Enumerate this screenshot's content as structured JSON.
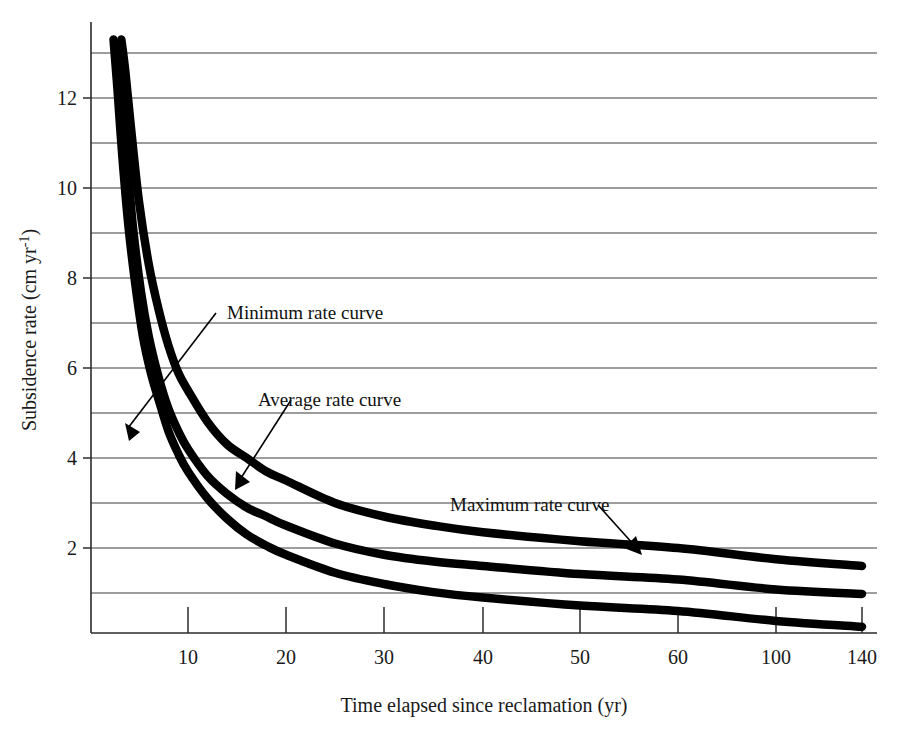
{
  "chart_data": {
    "type": "line",
    "title": "",
    "xlabel": "Time elapsed since reclamation (yr)",
    "ylabel": "Subsidence rate (cm yr-1)",
    "ylabel_parts": {
      "main": "Subsidence rate (cm yr",
      "superscript": "-1",
      "tail": ")"
    },
    "grid": true,
    "legend_position": "inline-annotations",
    "x_tick_labels": [
      "10",
      "20",
      "30",
      "40",
      "50",
      "60",
      "100",
      "140"
    ],
    "x_tick_values": [
      10,
      20,
      30,
      40,
      50,
      60,
      100,
      140
    ],
    "x_scale_note": "compressed / non-linear beyond 60",
    "y_tick_labels": [
      "2",
      "4",
      "6",
      "8",
      "10",
      "12"
    ],
    "y_tick_values": [
      2,
      4,
      6,
      8,
      10,
      12
    ],
    "y_gridline_values": [
      1,
      2,
      3,
      4,
      5,
      6,
      7,
      8,
      9,
      10,
      11,
      12,
      13
    ],
    "ylim": [
      0,
      13.4
    ],
    "annotations": [
      {
        "id": "minimum",
        "label": "Minimum rate curve"
      },
      {
        "id": "average",
        "label": "Average rate curve"
      },
      {
        "id": "maximum",
        "label": "Maximum rate curve"
      }
    ],
    "series": [
      {
        "name": "Maximum rate curve",
        "points_x": [
          3.2,
          3.6,
          4.2,
          5.0,
          6.0,
          7.0,
          8.0,
          9.0,
          10.0,
          12.0,
          14.0,
          16.0,
          18.0,
          20.0,
          25.0,
          30.0,
          35.0,
          40.0,
          50.0,
          60.0,
          100.0,
          140.0
        ],
        "points_y": [
          13.3,
          12.6,
          11.3,
          9.7,
          8.3,
          7.3,
          6.5,
          5.9,
          5.5,
          4.8,
          4.3,
          4.0,
          3.7,
          3.5,
          3.0,
          2.7,
          2.5,
          2.35,
          2.15,
          2.0,
          1.75,
          1.6
        ]
      },
      {
        "name": "Average rate curve",
        "points_x": [
          2.8,
          3.2,
          3.8,
          4.4,
          5.2,
          6.0,
          7.0,
          8.0,
          9.0,
          10.0,
          12.0,
          14.0,
          16.0,
          18.0,
          20.0,
          25.0,
          30.0,
          35.0,
          40.0,
          50.0,
          60.0,
          100.0,
          140.0
        ],
        "points_y": [
          13.2,
          12.3,
          10.6,
          9.1,
          7.7,
          6.7,
          5.8,
          5.1,
          4.6,
          4.2,
          3.6,
          3.2,
          2.9,
          2.7,
          2.5,
          2.1,
          1.85,
          1.7,
          1.6,
          1.42,
          1.3,
          1.08,
          0.98
        ]
      },
      {
        "name": "Minimum rate curve",
        "points_x": [
          2.4,
          2.8,
          3.3,
          3.9,
          4.6,
          5.4,
          6.2,
          7.0,
          8.0,
          9.0,
          10.0,
          12.0,
          14.0,
          16.0,
          18.0,
          20.0,
          25.0,
          30.0,
          35.0,
          40.0,
          50.0,
          60.0,
          100.0,
          140.0
        ],
        "points_y": [
          13.3,
          12.2,
          10.7,
          9.2,
          7.9,
          6.7,
          5.9,
          5.3,
          4.6,
          4.1,
          3.7,
          3.1,
          2.65,
          2.3,
          2.05,
          1.85,
          1.45,
          1.2,
          1.02,
          0.9,
          0.72,
          0.6,
          0.38,
          0.25
        ]
      }
    ]
  }
}
